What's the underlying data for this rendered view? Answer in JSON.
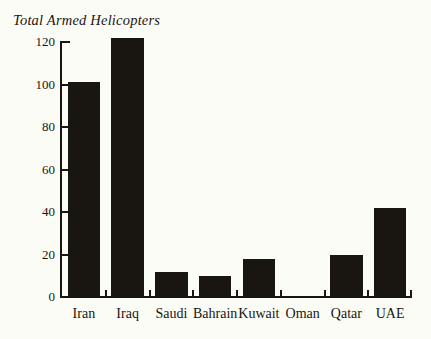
{
  "chart_data": {
    "type": "bar",
    "title": "Total Armed Helicopters",
    "xlabel": "",
    "ylabel": "",
    "categories": [
      "Iran",
      "Iraq",
      "Saudi",
      "Bahrain",
      "Kuwait",
      "Oman",
      "Qatar",
      "UAE"
    ],
    "values": [
      101,
      122,
      12,
      10,
      18,
      0,
      20,
      42
    ],
    "ylim": [
      0,
      128
    ],
    "yticks": [
      0,
      20,
      40,
      60,
      80,
      100,
      120
    ],
    "ytick_labels": [
      "0",
      "20",
      "40",
      "60",
      "80",
      "100",
      "120"
    ],
    "grid": false,
    "legend": null,
    "bar_color": "#191510",
    "background_color": "#fcfcf7",
    "axis_color": "#191510"
  }
}
